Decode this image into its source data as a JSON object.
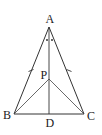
{
  "diagram": {
    "type": "geometry",
    "points": {
      "A": {
        "label": "A",
        "x": 49,
        "y": 27
      },
      "B": {
        "label": "B",
        "x": 14,
        "y": 114
      },
      "C": {
        "label": "C",
        "x": 84,
        "y": 114
      },
      "D": {
        "label": "D",
        "x": 49,
        "y": 114
      },
      "P": {
        "label": "P",
        "x": 49,
        "y": 79
      }
    },
    "segments": [
      [
        "A",
        "B"
      ],
      [
        "A",
        "C"
      ],
      [
        "B",
        "C"
      ],
      [
        "A",
        "D"
      ],
      [
        "P",
        "B"
      ],
      [
        "P",
        "C"
      ]
    ],
    "equal_marks": [
      [
        "A",
        "B"
      ],
      [
        "A",
        "C"
      ]
    ],
    "angle_marks": {
      "vertex": "A",
      "style": "dots",
      "count": 2,
      "meaning": "angle BAD = angle CAD"
    },
    "colors": {
      "stroke": "#333333",
      "text": "#222222",
      "background": "#ffffff"
    }
  }
}
